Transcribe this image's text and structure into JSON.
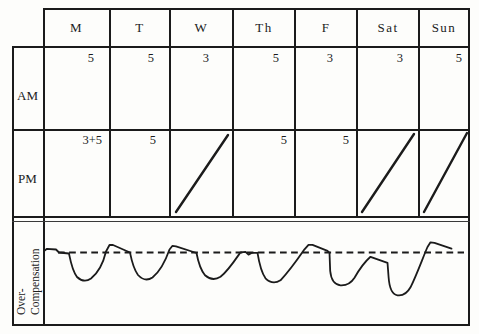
{
  "header": {
    "days": [
      "M",
      "T",
      "W",
      "Th",
      "F",
      "Sat",
      "Sun"
    ]
  },
  "table": {
    "am_label": "AM",
    "pm_label": "PM",
    "over_label_line1": "Over-",
    "over_label_line2": "Compensation",
    "am_values": [
      "5",
      "5",
      "3",
      "5",
      "3",
      "3",
      "5"
    ],
    "pm_cells": [
      {
        "day": "M",
        "value": "3+5",
        "diagonal": false
      },
      {
        "day": "T",
        "value": "5",
        "diagonal": false
      },
      {
        "day": "W",
        "value": "",
        "diagonal": true
      },
      {
        "day": "Th",
        "value": "5",
        "diagonal": false
      },
      {
        "day": "F",
        "value": "5",
        "diagonal": false
      },
      {
        "day": "Sat",
        "value": "",
        "diagonal": true
      },
      {
        "day": "Sun",
        "value": "",
        "diagonal": true
      }
    ]
  },
  "curve": {
    "type": "line",
    "description": "Hand-drawn over-compensation curve: repeated deep dips below a dashed baseline followed by overshoot peaks above it, decaying back to the line before each next dip; six cycles across the week, final dip deepest.",
    "baseline_d": "M 58 252.5 L 464 252.5",
    "path_d": "M 44 251 L 47 248.8 L 56 249.5 L 59 252.5 L 69 253.5 C 70.5 261 72 270 77 277 Q 84 283.5 91 278.5 C 98 273 103.5 262 106 251.5 L 109.5 245 L 113 245 L 130 252.5 C 131.5 260 133 268 138 275 Q 145 282.5 152.5 277.5 C 160 271.5 166.5 258 169.5 249.5 L 172.5 245.8 L 176 246.3 L 196.5 253 C 198 261 200 269 205 275.3 Q 212.5 281.8 220.5 276.8 C 228 271 236.5 258 240.5 252.3 L 245.5 251.8 L 248.5 254.6 L 252 252.8 L 257.5 252.8 C 259 262 260.5 271 265.5 278.3 Q 272.5 285.3 280.5 280.3 C 288 272.5 298.5 258 304.5 249.3 L 308.5 244.8 L 312.5 244.8 L 327.5 250.8 L 329.5 252.8 L 330.2 271 Q 331.5 284.3 340.5 285.3 Q 349.5 285.8 354.5 277.8 C 360.5 267.3 366.5 260.3 370.5 256.8 L 387.5 262.8 L 388.6 277.3 Q 389.8 294.3 397.5 295.3 Q 405.5 296.3 410.5 287.3 C 416.5 275.5 423.5 256 427.5 247 L 430.5 242.3 L 434.5 242.8 L 451.5 248.6"
  },
  "colors": {
    "ink": "#1b1b1b",
    "paper": "#fdfdfb"
  }
}
